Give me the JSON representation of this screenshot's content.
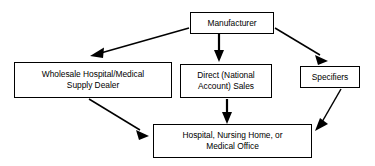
{
  "diagram": {
    "type": "flowchart",
    "background_color": "#ffffff",
    "line_color": "#000000",
    "text_color": "#000000",
    "nodes": [
      {
        "id": "manufacturer",
        "label": "Manufacturer",
        "shape": "rectangle",
        "level": "top"
      },
      {
        "id": "wholesale",
        "label": "Wholesale Hospital/Medical\nSupply Dealer",
        "shape": "rectangle",
        "level": "middle"
      },
      {
        "id": "direct",
        "label": "Direct (National\nAccount) Sales",
        "shape": "rectangle",
        "level": "middle"
      },
      {
        "id": "specifiers",
        "label": "Specifiers",
        "shape": "rectangle",
        "level": "middle"
      },
      {
        "id": "endpoint",
        "label": "Hospital, Nursing Home, or\nMedical Office",
        "shape": "rectangle",
        "level": "bottom"
      }
    ],
    "edges": [
      {
        "id": "manufacturer-to-wholesale",
        "from": "manufacturer",
        "to": "wholesale",
        "style": "solid",
        "arrowhead": "filled-triangle",
        "direction": "down-left"
      },
      {
        "id": "manufacturer-to-direct",
        "from": "manufacturer",
        "to": "direct",
        "style": "solid",
        "arrowhead": "filled-triangle",
        "direction": "down"
      },
      {
        "id": "manufacturer-to-specifiers",
        "from": "manufacturer",
        "to": "specifiers",
        "style": "solid",
        "arrowhead": "filled-triangle",
        "direction": "down-right"
      },
      {
        "id": "wholesale-to-endpoint",
        "from": "wholesale",
        "to": "endpoint",
        "style": "solid",
        "arrowhead": "filled-triangle",
        "direction": "down-right"
      },
      {
        "id": "direct-to-endpoint",
        "from": "direct",
        "to": "endpoint",
        "style": "solid",
        "arrowhead": "filled-triangle",
        "direction": "down"
      },
      {
        "id": "specifiers-to-endpoint",
        "from": "specifiers",
        "to": "endpoint",
        "style": "solid",
        "arrowhead": "filled-triangle",
        "direction": "down-left"
      }
    ]
  }
}
